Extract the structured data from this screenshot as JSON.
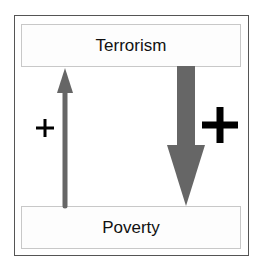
{
  "diagram": {
    "type": "causal-loop",
    "nodes": [
      {
        "id": "terrorism",
        "label": "Terrorism",
        "position": "top"
      },
      {
        "id": "poverty",
        "label": "Poverty",
        "position": "bottom"
      }
    ],
    "edges": [
      {
        "id": "poverty-to-terrorism",
        "from": "poverty",
        "to": "terrorism",
        "direction": "up",
        "weight": "thin",
        "polarity": "+",
        "polarity_size": "small"
      },
      {
        "id": "terrorism-to-poverty",
        "from": "terrorism",
        "to": "poverty",
        "direction": "down",
        "weight": "thick",
        "polarity": "+",
        "polarity_size": "large"
      }
    ],
    "colors": {
      "arrow": "#666666",
      "sign": "#000000",
      "frame_border": "#555555",
      "node_border": "#c8c8c8",
      "text": "#111111"
    }
  }
}
